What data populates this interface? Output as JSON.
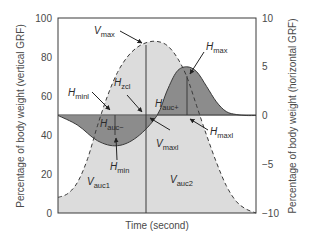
{
  "chart_data": {
    "type": "area",
    "title": "",
    "xlabel": "Time (second)",
    "ylabel_left": "Percentage of body weight (vertical GRF)",
    "ylabel_right": "Percentage of body weight (horizontal GRF)",
    "ylim_left": [
      0,
      100
    ],
    "ylim_right": [
      -10,
      10
    ],
    "yticks_left": [
      0,
      20,
      40,
      60,
      80,
      100
    ],
    "yticks_right": [
      -10,
      -5,
      0,
      5,
      10
    ],
    "xticks": [],
    "grid": false,
    "legend": null,
    "series": [
      {
        "name": "Vertical GRF",
        "axis": "left",
        "style": "dashed",
        "fill": "#dcdcdc",
        "description": "Bell-shaped vertical force curve, peak ~88% body weight at mid-stance",
        "x": [
          0.0,
          0.05,
          0.1,
          0.15,
          0.2,
          0.25,
          0.3,
          0.35,
          0.4,
          0.45,
          0.5,
          0.55,
          0.6,
          0.65,
          0.7,
          0.75,
          0.8,
          0.85,
          0.9,
          0.95,
          1.0
        ],
        "values": [
          8,
          10,
          16,
          28,
          45,
          60,
          72,
          80,
          85,
          87.5,
          88,
          86,
          80,
          70,
          55,
          40,
          26,
          14,
          6,
          2,
          0
        ]
      },
      {
        "name": "Horizontal GRF",
        "axis": "right",
        "style": "solid",
        "fill": "#8c8c8c",
        "description": "Braking (negative) phase then propulsive (positive) phase",
        "x": [
          0.0,
          0.1,
          0.2,
          0.3,
          0.4,
          0.5,
          0.55,
          0.6,
          0.65,
          0.7,
          0.75,
          0.8,
          0.85,
          0.9,
          0.95,
          1.0
        ],
        "values": [
          0,
          -1.0,
          -2.6,
          -3.1,
          -2.2,
          0,
          2.5,
          4.5,
          5.0,
          4.5,
          3.0,
          1.4,
          0.4,
          0.1,
          0,
          0
        ]
      }
    ],
    "annotations": [
      {
        "label": "V",
        "sub": "max",
        "meaning": "Peak vertical GRF"
      },
      {
        "label": "H",
        "sub": "max",
        "meaning": "Peak propulsive horizontal GRF"
      },
      {
        "label": "H",
        "sub": "minI",
        "meaning": "Impulse time to minimum horizontal GRF"
      },
      {
        "label": "H",
        "sub": "zcl",
        "meaning": "Horizontal zero-crossing time"
      },
      {
        "label": "H",
        "sub": "auc+",
        "meaning": "Area under curve, propulsive phase"
      },
      {
        "label": "H",
        "sub": "auc−",
        "meaning": "Area under curve, braking phase"
      },
      {
        "label": "H",
        "sub": "maxI",
        "meaning": "Time to maximum horizontal GRF"
      },
      {
        "label": "V",
        "sub": "maxI",
        "meaning": "Time to maximum vertical GRF"
      },
      {
        "label": "H",
        "sub": "min",
        "meaning": "Minimum (braking) horizontal GRF"
      },
      {
        "label": "V",
        "sub": "auc1",
        "meaning": "Vertical area under curve, first half"
      },
      {
        "label": "V",
        "sub": "auc2",
        "meaning": "Vertical area under curve, second half"
      }
    ]
  },
  "labels": {
    "x_axis": "Time (second)",
    "y_left": "Percentage of body weight (vertical GRF)",
    "y_right": "Percentage of body weight (horizontal GRF)",
    "ticks_left": [
      "100",
      "80",
      "60",
      "40",
      "20",
      "0"
    ],
    "ticks_right": [
      "10",
      "5",
      "0",
      "−5",
      "−10"
    ],
    "ann": {
      "vmax": {
        "main": "V",
        "sub": "max"
      },
      "hmax": {
        "main": "H",
        "sub": "max"
      },
      "hminl": {
        "main": "H",
        "sub": "minl"
      },
      "hzcl": {
        "main": "H",
        "sub": "zcl"
      },
      "haucp": {
        "main": "H",
        "sub": "auc+"
      },
      "haucm": {
        "main": "H",
        "sub": "auc−"
      },
      "hmaxl": {
        "main": "H",
        "sub": "maxl"
      },
      "vmaxl": {
        "main": "V",
        "sub": "maxl"
      },
      "hmin": {
        "main": "H",
        "sub": "min"
      },
      "vauc1": {
        "main": "V",
        "sub": "auc1"
      },
      "vauc2": {
        "main": "V",
        "sub": "auc2"
      }
    }
  },
  "colors": {
    "vertical_fill": "#dcdcdc",
    "horizontal_fill": "#8c8c8c",
    "horizontal_fill_dark": "#7a7a7a",
    "axis": "#3a3a3a",
    "curve": "#3a3a3a"
  }
}
